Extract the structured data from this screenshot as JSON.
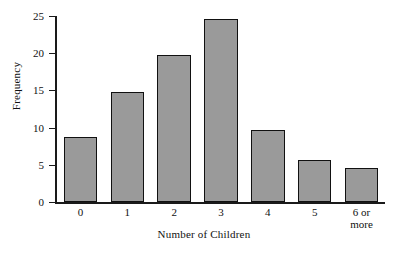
{
  "chart_data": {
    "type": "bar",
    "title": "",
    "xlabel": "Number of Children",
    "ylabel": "Frequency",
    "categories": [
      "0",
      "1",
      "2",
      "3",
      "4",
      "5",
      "6 or\nmore"
    ],
    "values": [
      8.8,
      14.8,
      19.8,
      24.6,
      9.7,
      5.6,
      4.6
    ],
    "ylim": [
      0,
      25
    ],
    "yticks": [
      0,
      5,
      10,
      15,
      20,
      25
    ],
    "ytick_labels": [
      "0",
      "5",
      "10",
      "15",
      "20",
      "25"
    ],
    "grid": false,
    "legend": false,
    "bar_color": "#9a9a9a",
    "bar_edge_color": "#111111",
    "axis_color": "#1a1a1a",
    "background": "#ffffff"
  }
}
